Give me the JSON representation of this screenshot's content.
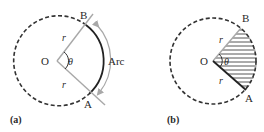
{
  "figure_a": {
    "panel_label": "(a)",
    "center_label": "O",
    "point_b_label": "B",
    "point_a_label": "A",
    "radius_label_top": "r",
    "radius_label_bottom": "r",
    "angle_label": "θ",
    "arc_label": "Arc"
  },
  "figure_b": {
    "panel_label": "(b)",
    "center_label": "O",
    "point_b_label": "B",
    "point_a_label": "A",
    "radius_label_top": "r",
    "radius_label_bottom": "r",
    "angle_label": "θ"
  },
  "colors": {
    "dashed_circle": "#333333",
    "radius_line": "#a8a8a8",
    "arc_solid": "#222222",
    "arc_arrow": "#a8a8a8",
    "hatch": "#555555"
  }
}
